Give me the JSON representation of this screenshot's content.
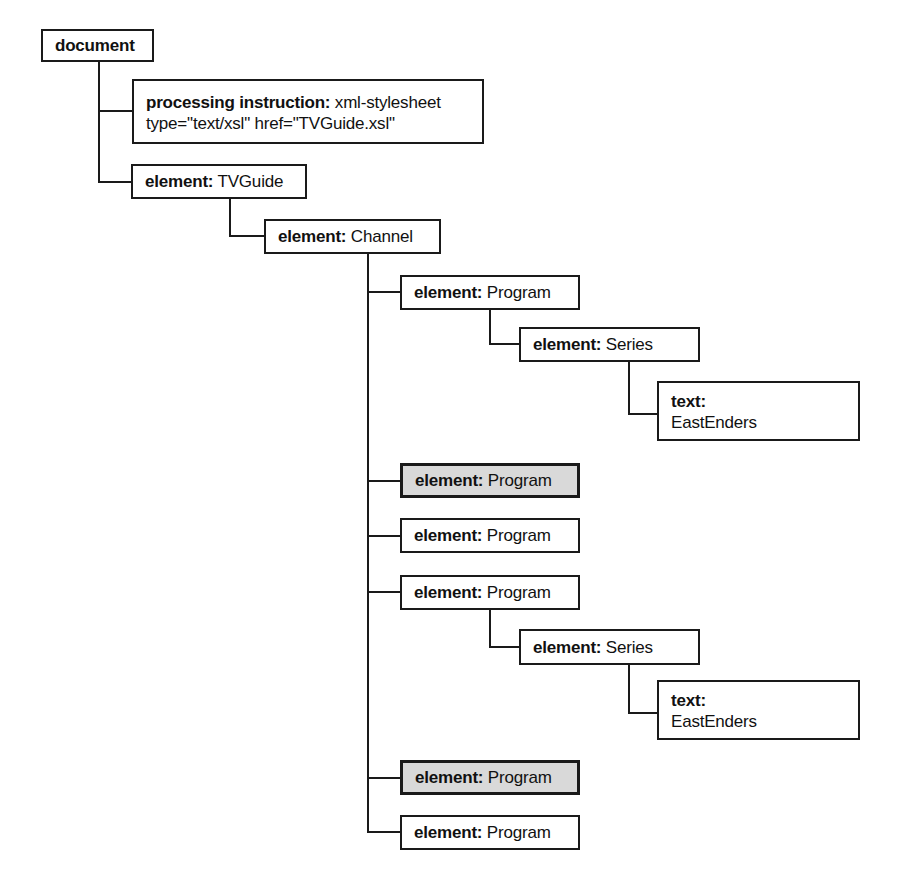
{
  "diagram": {
    "colors": {
      "line": "#1a1a1a",
      "box_fill": "#ffffff",
      "highlight_fill": "#d9d9d9",
      "text": "#111111"
    },
    "nodes": [
      {
        "id": "document",
        "label": "document",
        "value": "",
        "highlighted": false,
        "lines": 1
      },
      {
        "id": "processing-instruction",
        "label": "processing instruction:",
        "value": " xml-stylesheet",
        "value2": "type=\"text/xsl\" href=\"TVGuide.xsl\"",
        "highlighted": false,
        "lines": 2
      },
      {
        "id": "element-tvguide",
        "label": "element:",
        "value": " TVGuide",
        "highlighted": false,
        "lines": 1
      },
      {
        "id": "element-channel",
        "label": "element:",
        "value": " Channel",
        "highlighted": false,
        "lines": 1
      },
      {
        "id": "element-program-1",
        "label": "element:",
        "value": " Program",
        "highlighted": false,
        "lines": 1
      },
      {
        "id": "element-series-1",
        "label": "element:",
        "value": " Series",
        "highlighted": false,
        "lines": 1
      },
      {
        "id": "text-eastenders-1",
        "label": "text:",
        "value": "EastEnders",
        "highlighted": false,
        "lines": 2
      },
      {
        "id": "element-program-2",
        "label": "element:",
        "value": " Program",
        "highlighted": true,
        "lines": 1
      },
      {
        "id": "element-program-3",
        "label": "element:",
        "value": " Program",
        "highlighted": false,
        "lines": 1
      },
      {
        "id": "element-program-4",
        "label": "element:",
        "value": " Program",
        "highlighted": false,
        "lines": 1
      },
      {
        "id": "element-series-2",
        "label": "element:",
        "value": " Series",
        "highlighted": false,
        "lines": 1
      },
      {
        "id": "text-eastenders-2",
        "label": "text:",
        "value": "EastEnders",
        "highlighted": false,
        "lines": 2
      },
      {
        "id": "element-program-5",
        "label": "element:",
        "value": " Program",
        "highlighted": true,
        "lines": 1
      },
      {
        "id": "element-program-6",
        "label": "element:",
        "value": " Program",
        "highlighted": false,
        "lines": 1
      }
    ]
  }
}
